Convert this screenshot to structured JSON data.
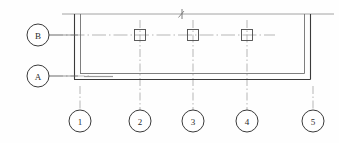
{
  "drawing": {
    "type": "architectural-floor-plan",
    "title": "",
    "background_color": "#fefefe",
    "line_color": "#3a3a3a",
    "thin_line_color": "#8d8d8d",
    "center_line_color": "#9a9a9a",
    "bubble_stroke_color": "#3a3a3a",
    "text_color": "#2b2b2b"
  },
  "grid_bubbles": {
    "horizontal_axes": [
      {
        "label": "B",
        "cx": 38,
        "cy": 35,
        "r": 11,
        "leader_x2": 78
      },
      {
        "label": "A",
        "cx": 38,
        "cy": 76,
        "r": 11,
        "leader_x2": 78
      }
    ],
    "vertical_axes": [
      {
        "label": "1",
        "cx": 80,
        "cy": 121,
        "r": 11,
        "leader_y1": 86
      },
      {
        "label": "2",
        "cx": 140,
        "cy": 121,
        "r": 11,
        "leader_y1": 50
      },
      {
        "label": "3",
        "cx": 193,
        "cy": 121,
        "r": 11,
        "leader_y1": 50
      },
      {
        "label": "4",
        "cx": 247,
        "cy": 121,
        "r": 11,
        "leader_y1": 50
      },
      {
        "label": "5",
        "cx": 313,
        "cy": 121,
        "r": 11,
        "leader_y1": 86
      }
    ]
  },
  "walls": {
    "outer_top_y": 14,
    "outer_left_x": 74,
    "outer_right_x": 310,
    "outer_bottom_y": 79,
    "inner_left_x": 80,
    "inner_right_x": 304,
    "inner_bottom_y": 73,
    "top_line_x1": 62,
    "top_line_x2": 334
  },
  "columns": [
    {
      "name": "column-2B",
      "cx": 140,
      "cy": 35,
      "size": 11
    },
    {
      "name": "column-3B",
      "cx": 193,
      "cy": 35,
      "size": 11
    },
    {
      "name": "column-4B",
      "cx": 247,
      "cy": 35,
      "size": 11
    }
  ],
  "annotations": {
    "top_break_mark": {
      "x": 182,
      "y": 14,
      "label": "break-tick"
    },
    "lower_left_hatch": {
      "x1": 84,
      "y1": 76,
      "x2": 113,
      "y2": 76
    }
  }
}
